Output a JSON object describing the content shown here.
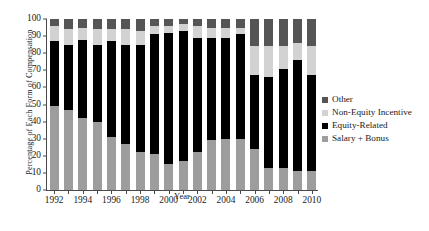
{
  "chart_data": {
    "type": "bar",
    "stacked": true,
    "title": "",
    "xlabel": "Year",
    "ylabel": "Percentage of Each Form of Compensation",
    "ylim": [
      0,
      100
    ],
    "yticks": [
      0,
      10,
      20,
      30,
      40,
      50,
      60,
      70,
      80,
      90,
      100
    ],
    "grid": false,
    "legend_position": "right",
    "categories": [
      "1992",
      "1993",
      "1994",
      "1995",
      "1996",
      "1997",
      "1998",
      "1999",
      "2000",
      "2001",
      "2002",
      "2003",
      "2004",
      "2005",
      "2006",
      "2007",
      "2008",
      "2009",
      "2010"
    ],
    "xtick_labels": [
      "1992",
      "1994",
      "1996",
      "1998",
      "2000",
      "2002",
      "2004",
      "2006",
      "2008",
      "2010"
    ],
    "series": [
      {
        "name": "Salary + Bonus",
        "color": "#9d9d9d",
        "values": [
          49,
          47,
          42,
          40,
          31,
          27,
          22,
          21,
          15,
          17,
          22,
          29,
          30,
          30,
          24,
          13,
          13,
          11,
          11
        ]
      },
      {
        "name": "Equity-Related",
        "color": "#000000",
        "values": [
          38,
          38,
          46,
          45,
          56,
          58,
          63,
          70,
          77,
          76,
          67,
          60,
          59,
          61,
          43,
          53,
          58,
          65,
          56
        ]
      },
      {
        "name": "Non-Equity Incentive",
        "color": "#d2d2d2",
        "values": [
          9,
          9,
          7,
          9,
          7,
          9,
          8,
          5,
          4,
          4,
          7,
          6,
          6,
          4,
          17,
          18,
          13,
          10,
          17
        ]
      },
      {
        "name": "Other",
        "color": "#555555",
        "values": [
          4,
          6,
          5,
          6,
          6,
          6,
          7,
          4,
          4,
          3,
          4,
          5,
          5,
          5,
          16,
          16,
          16,
          14,
          16
        ]
      }
    ]
  },
  "legend": {
    "entries": [
      {
        "label": "Other",
        "color": "#555555"
      },
      {
        "label": "Non-Equity Incentive",
        "color": "#d2d2d2"
      },
      {
        "label": "Equity-Related",
        "color": "#000000"
      },
      {
        "label": "Salary + Bonus",
        "color": "#9d9d9d"
      }
    ]
  }
}
